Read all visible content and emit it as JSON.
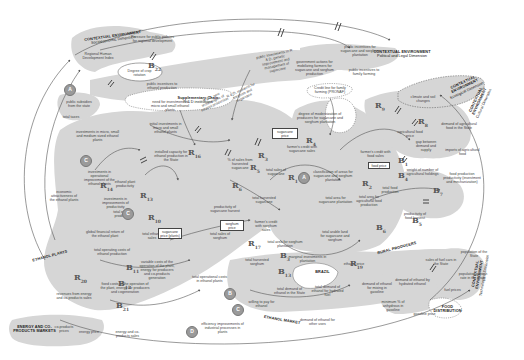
{
  "diagram": {
    "type": "causal-loop-diagram",
    "theme": {
      "background": "#ffffff",
      "region_fill": "#d6d6d6",
      "line_color": "#555555",
      "circle_fill": "#9a9a9a"
    },
    "contexts": [
      {
        "title": "CONTEXTUAL ENVIRONMENT",
        "subtitle": "Socioeconomic Dimension"
      },
      {
        "title": "CONTEXTUAL ENVIRONMENT",
        "subtitle": "Political and Legal Dimension"
      },
      {
        "title": "CONTEXTUAL ENVIRONMENT",
        "subtitle": "Ecological Dimension"
      },
      {
        "title": "CONTEXTUAL ENVIRONMENT",
        "subtitle": "Technological Dimension"
      },
      {
        "title": "CONTEXTUAL ENVIRONMENT",
        "subtitle": "Cultural Dimension"
      },
      {
        "title": "Supplementary Chain",
        "subtitle": "R & D institutions"
      }
    ],
    "zones": [
      {
        "label": "ETHANOL PLANTS"
      },
      {
        "label": "RURAL PRODUCERS"
      },
      {
        "label": "ETHANOL MARKET"
      },
      {
        "label": "ENERGY AND CO-PRODUCTS MARKETS"
      },
      {
        "label": "BRAZIL"
      },
      {
        "label": "FOOD DISTRIBUTION"
      }
    ],
    "nodes": [
      "Regional Human Development Index",
      "Pressure for public policies for regional development",
      "Degree of crop rotation",
      "public incentives to ethanol production",
      "public subsidies from the state",
      "total taxes",
      "public investments in R & D, genetic improvement and management of sugarcane",
      "government actions for mobilizing farmers for sugarcane and sorghum production",
      "public incentives for sugarcane and sorghum plantation",
      "Credit line for family farming (PRONAF)",
      "public incentives to family farming",
      "R & D, research for sorghum and sugarcane",
      "R & D, new technologies of ethanol production",
      "need for investment in micro and small ethanol plants",
      "investments in micro, small and medium sized ethanol plants",
      "initial investments in micro and small ethanol plants",
      "installed capacity for ethanol production in the State",
      "investments in operational improvement of the ethanol plants",
      "investments in improvements of productivity",
      "economic attractiveness of the ethanol plants",
      "global financial return of the ethanol plant",
      "ethanol plant productivity",
      "degree of modernization of producers for sugarcane and sorghum plantation",
      "sugarcane price",
      "farmer's credit with sugarcane sales",
      "% of sales from harvested sugarcane",
      "total sales of sugarcane",
      "total harvested sugarcane",
      "productivity of sugarcane harvest",
      "farmer's credit with sorghum sales",
      "total sales of sorghum",
      "total area for sorghum plantation",
      "total harvested sorghum",
      "sorghum price",
      "classification of areas for sugarcane and sorghum plantation",
      "total area for sugarcane plantation",
      "total area for agricultural food production",
      "total arable land for sugarcane and sorghum",
      "marginal investments in plantation",
      "farmer's credit with food sales",
      "food price",
      "total food production",
      "agricultural food price",
      "demand of agricultural food in the State",
      "gap between demand and supply",
      "imports of agricultural food",
      "productivity of food harvest",
      "food production productivity (investment and mechanization)",
      "weight of number of agricultural holdings",
      "sales of fuel cars in the State",
      "population growth rate in the State",
      "population of the State",
      "total demand of ethanol in the State",
      "total demand of ethanol for hydrated fuel",
      "demand of ethanol for mixing in gasoline",
      "demand of ethanol by hydrated ethanol",
      "minimum % of anhydrous in gasoline",
      "total ethanol production",
      "total ethanol sales",
      "total operating costs of ethanol production",
      "fixed costs of the operation of the plant, energy for producers and cogeneration",
      "variable costs of the operation of the plant, energy for producers and co-products generation",
      "energy and co-products sales",
      "revenues from energy and co-products sales",
      "co-products prices",
      "energy price",
      "ethanol price",
      "willing to pay for ethanol",
      "efficiency improvements of industrial processes in plants",
      "demand of ethanol for other uses",
      "total operational costs in ethanol plants",
      "fuel prices",
      "gasoline price",
      "climate and soil changes",
      "Gasoline in Brazil",
      "Infrastructure"
    ],
    "boxed_nodes": [
      "sugarcane price",
      "sorghum price",
      "food price",
      "sugarcane price (plants)"
    ],
    "loops": [
      {
        "id": "R1"
      },
      {
        "id": "R2"
      },
      {
        "id": "R3"
      },
      {
        "id": "R4"
      },
      {
        "id": "R5"
      },
      {
        "id": "R6"
      },
      {
        "id": "R8"
      },
      {
        "id": "R9"
      },
      {
        "id": "R10"
      },
      {
        "id": "R13"
      },
      {
        "id": "R14"
      },
      {
        "id": "R16"
      },
      {
        "id": "R17"
      },
      {
        "id": "R20"
      },
      {
        "id": "B1"
      },
      {
        "id": "B3"
      },
      {
        "id": "B4"
      },
      {
        "id": "B5"
      },
      {
        "id": "B6"
      },
      {
        "id": "B7"
      },
      {
        "id": "B11"
      },
      {
        "id": "B12"
      },
      {
        "id": "B13"
      },
      {
        "id": "B21"
      },
      {
        "id": "B22"
      }
    ],
    "circles": [
      "A",
      "A",
      "C",
      "C",
      "B",
      "C",
      "D"
    ]
  }
}
